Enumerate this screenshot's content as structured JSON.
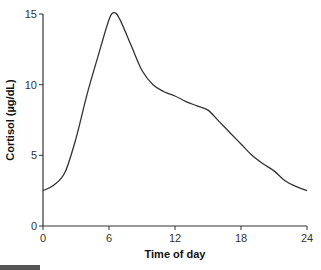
{
  "chart_data": {
    "type": "line",
    "title": "",
    "xlabel": "Time of day",
    "ylabel": "Cortisol (µg/dL)",
    "xlim": [
      0,
      24
    ],
    "ylim": [
      0,
      15
    ],
    "xticks": [
      "0",
      "6",
      "12",
      "18",
      "24"
    ],
    "yticks": [
      "0",
      "5",
      "10",
      "15"
    ],
    "grid": false,
    "legend": null,
    "series": [
      {
        "name": "Cortisol",
        "x": [
          0,
          1,
          2,
          3,
          4,
          5,
          6,
          6.5,
          7,
          8,
          9,
          10,
          11,
          12,
          13,
          14,
          15,
          16,
          17,
          18,
          19,
          20,
          21,
          22,
          23,
          24
        ],
        "y": [
          2.5,
          2.9,
          3.8,
          6.2,
          9.3,
          12.0,
          14.6,
          15.1,
          14.6,
          12.8,
          11.0,
          10.0,
          9.5,
          9.2,
          8.8,
          8.5,
          8.2,
          7.4,
          6.6,
          5.8,
          5.0,
          4.4,
          3.9,
          3.2,
          2.8,
          2.5
        ]
      }
    ]
  }
}
